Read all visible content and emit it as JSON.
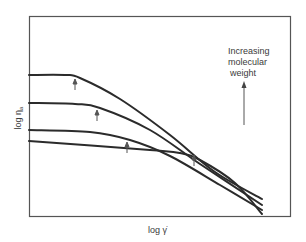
{
  "chart_data": {
    "type": "line",
    "title": "",
    "xlabel": "log γ̇",
    "ylabel": "log η",
    "ylabel_subscript": "a",
    "grid": false,
    "ticks": "none",
    "annotation": {
      "lines": [
        "Increasing",
        "molecular",
        "weight"
      ],
      "arrow": "up"
    },
    "series": [
      {
        "name": "highest molecular weight",
        "points_px": [
          [
            29,
            75
          ],
          [
            65,
            75
          ],
          [
            80,
            78
          ],
          [
            120,
            99
          ],
          [
            170,
            135
          ],
          [
            215,
            172
          ],
          [
            262,
            199
          ]
        ],
        "transition_marker_px": [
          75,
          79
        ]
      },
      {
        "name": "high molecular weight",
        "points_px": [
          [
            29,
            103
          ],
          [
            75,
            104
          ],
          [
            100,
            108
          ],
          [
            150,
            130
          ],
          [
            200,
            164
          ],
          [
            262,
            205
          ]
        ],
        "transition_marker_px": [
          97,
          110
        ]
      },
      {
        "name": "medium molecular weight",
        "points_px": [
          [
            29,
            130
          ],
          [
            90,
            132
          ],
          [
            130,
            140
          ],
          [
            170,
            156
          ],
          [
            220,
            185
          ],
          [
            262,
            210
          ]
        ],
        "transition_marker_px": [
          127,
          142
        ]
      },
      {
        "name": "lowest molecular weight",
        "points_px": [
          [
            29,
            141
          ],
          [
            150,
            150
          ],
          [
            180,
            153
          ],
          [
            200,
            160
          ],
          [
            235,
            183
          ],
          [
            262,
            214
          ]
        ],
        "transition_marker_px": [
          194,
          155
        ]
      }
    ],
    "frame_px": {
      "left": 29,
      "top": 16,
      "right": 290,
      "bottom": 216
    }
  },
  "colors": {
    "ink": "#2b2b2b",
    "frame": "#555555",
    "label": "#3a3a3a"
  }
}
